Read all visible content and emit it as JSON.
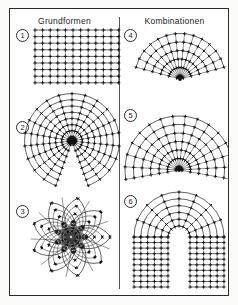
{
  "figure": {
    "columns": [
      {
        "id": "grundformen",
        "title": "Grundformen"
      },
      {
        "id": "kombinationen",
        "title": "Kombinationen"
      }
    ],
    "panels": [
      {
        "index": "1",
        "column": "grundformen",
        "kind": "cartesian-grid"
      },
      {
        "index": "2",
        "column": "grundformen",
        "kind": "polar-grid"
      },
      {
        "index": "3",
        "column": "grundformen",
        "kind": "rosette-spiral"
      },
      {
        "index": "4",
        "column": "kombinationen",
        "kind": "fan-sector-narrow"
      },
      {
        "index": "5",
        "column": "kombinationen",
        "kind": "fan-sector-wide"
      },
      {
        "index": "6",
        "column": "kombinationen",
        "kind": "arch-horseshoe"
      }
    ]
  },
  "chart_data": {
    "type": "diagram",
    "panels": [
      {
        "index": "1",
        "kind": "cartesian-grid",
        "column": "Grundformen",
        "rows": 8,
        "cols": 11,
        "cell_w": 7.6,
        "cell_h": 6.6,
        "tick": "cross"
      },
      {
        "index": "2",
        "kind": "polar-grid",
        "column": "Grundformen",
        "rings": 7,
        "ring_step": 6.2,
        "inner_radius": 4,
        "spokes": 20,
        "sweep_deg": 320,
        "gap_deg": 40,
        "hub": true,
        "tick": "cross"
      },
      {
        "index": "3",
        "kind": "rosette-spiral",
        "column": "Grundformen",
        "petals": 9,
        "arcs_per_petal": 4,
        "core_radius": 9,
        "outer_radius": 44,
        "tick": "cross"
      },
      {
        "index": "4",
        "kind": "fan-sector-narrow",
        "column": "Kombinationen",
        "rings": 5,
        "ring_step": 8.5,
        "spokes": 13,
        "sweep_deg": 150,
        "apex": "bottom-center",
        "tick": "cross"
      },
      {
        "index": "5",
        "kind": "fan-sector-wide",
        "column": "Kombinationen",
        "rings": 6,
        "ring_step": 8.5,
        "spokes": 15,
        "sweep_deg": 200,
        "apex": "bottom-center",
        "tick": "cross"
      },
      {
        "index": "6",
        "kind": "arch-horseshoe",
        "column": "Kombinationen",
        "arc_rings": 5,
        "leg_rows": 9,
        "inner_radius": 11,
        "outer_radius": 45,
        "tick": "cross"
      }
    ],
    "legend": [],
    "xlabel": "",
    "ylabel": ""
  },
  "colors": {
    "frame": "#2b2b2b",
    "line": "#2f2f2f",
    "tick": "#111111",
    "background": "#ffffff",
    "page": "#fbfbfa"
  }
}
